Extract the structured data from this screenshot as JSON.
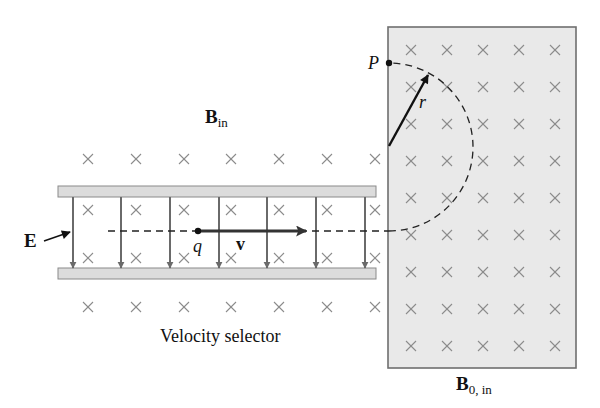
{
  "diagram": {
    "colors": {
      "background": "#ffffff",
      "region_fill": "#e9e9e9",
      "region_border": "#6f6f6f",
      "plate_fill": "#dcdcdc",
      "plate_border": "#8a8a8a",
      "field_arrow": "#6a6a6a",
      "cross": "#8c8c8c",
      "ink": "#111111"
    },
    "labels": {
      "b_in": {
        "main": "B",
        "sub": "in"
      },
      "b0_in": {
        "main": "B",
        "sub": "0, in"
      },
      "e_field": "E",
      "charge": "q",
      "velocity": "v",
      "point_p": "P",
      "radius": "r",
      "caption": "Velocity selector"
    },
    "velocity_selector": {
      "top_plate": {
        "x": 58,
        "y": 186,
        "w": 318,
        "h": 11
      },
      "bottom_plate": {
        "x": 58,
        "y": 268,
        "w": 318,
        "h": 11
      },
      "e_arrows_x": [
        73,
        121,
        170,
        219,
        267,
        316,
        365
      ],
      "e_arrow_y1": 197,
      "e_arrow_y2": 268,
      "cross_cols_x": [
        88,
        136,
        184,
        231,
        279,
        327,
        375
      ],
      "cross_rows_y": [
        210,
        258
      ],
      "outer_cross_rows_y": [
        159,
        307
      ]
    },
    "mass_spectrometer_region": {
      "x": 388,
      "y": 27,
      "w": 188,
      "h": 341,
      "cross_cols_x": [
        411,
        447,
        483,
        519,
        555
      ],
      "cross_rows_y": [
        50,
        87,
        124,
        161,
        198,
        235,
        272,
        309,
        346
      ]
    },
    "trajectory": {
      "line_y": 231,
      "line_x_start": 108,
      "line_x_end": 389,
      "semicircle_center": [
        389,
        147
      ],
      "semicircle_radius": 84,
      "point_p": [
        389,
        63
      ]
    },
    "particle": {
      "x": 198,
      "y": 231,
      "v_arrow_end_x": 306
    },
    "radius_arrow": {
      "x1": 389,
      "y1": 146,
      "x2": 428,
      "y2": 75
    }
  }
}
